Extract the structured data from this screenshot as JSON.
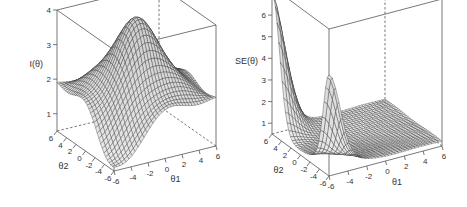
{
  "chart_data": [
    {
      "type": "surface3d",
      "title": "",
      "xlabel": "θ1",
      "ylabel": "θ2",
      "zlabel": "I(θ)",
      "xlim": [
        -6,
        6
      ],
      "ylim": [
        -6,
        6
      ],
      "zlim": [
        0.5,
        4
      ],
      "x_ticks": [
        "-6",
        "-4",
        "-2",
        "0",
        "2",
        "4",
        "6"
      ],
      "y_ticks": [
        "-6",
        "-4",
        "-2",
        "0",
        "2",
        "4",
        "6"
      ],
      "z_ticks": [
        "1",
        "2",
        "3",
        "4"
      ],
      "description": "Test information surface with a central peak near 4 at θ1=θ2=0, edges near 2, dipping toward ~0.6 at the front corner",
      "peak": {
        "theta1": 0,
        "theta2": 0,
        "value": 3.9
      },
      "grid": false
    },
    {
      "type": "surface3d",
      "title": "",
      "xlabel": "θ1",
      "ylabel": "θ2",
      "zlabel": "SE(θ)",
      "xlim": [
        -6,
        6
      ],
      "ylim": [
        -6,
        6
      ],
      "zlim": [
        0.5,
        7.3
      ],
      "x_ticks": [
        "-6",
        "-4",
        "-2",
        "0",
        "2",
        "4",
        "6"
      ],
      "y_ticks": [
        "-6",
        "-4",
        "-2",
        "0",
        "2",
        "4",
        "6"
      ],
      "z_ticks": [
        "1",
        "2",
        "3",
        "4",
        "5",
        "6",
        "7"
      ],
      "description": "Standard error surface, mostly flat near 0.6-0.9 with two sharp spikes at extreme corners (~7.2 and ~4.6)",
      "peaks": [
        {
          "theta1": -6,
          "theta2": 6,
          "value": 7.2
        },
        {
          "theta1": -6,
          "theta2": -6,
          "value": 4.6
        }
      ],
      "grid": false
    }
  ]
}
